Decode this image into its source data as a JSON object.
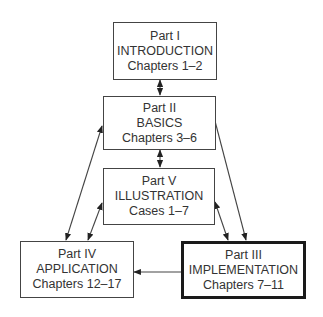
{
  "diagram": {
    "boxes": [
      {
        "id": "I",
        "part": "Part I",
        "title": "INTRODUCTION",
        "range": "Chapters 1–2"
      },
      {
        "id": "II",
        "part": "Part II",
        "title": "BASICS",
        "range": "Chapters 3–6"
      },
      {
        "id": "V",
        "part": "Part V",
        "title": "ILLUSTRATION",
        "range": "Cases 1–7"
      },
      {
        "id": "IV",
        "part": "Part IV",
        "title": "APPLICATION",
        "range": "Chapters 12–17"
      },
      {
        "id": "III",
        "part": "Part III",
        "title": "IMPLEMENTATION",
        "range": "Chapters 7–11",
        "highlighted": true
      }
    ],
    "edges": [
      {
        "from": "I",
        "to": "II",
        "type": "bidirectional"
      },
      {
        "from": "II",
        "to": "V",
        "type": "bidirectional"
      },
      {
        "from": "II",
        "to": "IV",
        "type": "bidirectional"
      },
      {
        "from": "V",
        "to": "IV",
        "type": "bidirectional"
      },
      {
        "from": "II",
        "to": "III",
        "type": "directed"
      },
      {
        "from": "V",
        "to": "III",
        "type": "bidirectional"
      },
      {
        "from": "III",
        "to": "IV",
        "type": "directed"
      }
    ]
  }
}
